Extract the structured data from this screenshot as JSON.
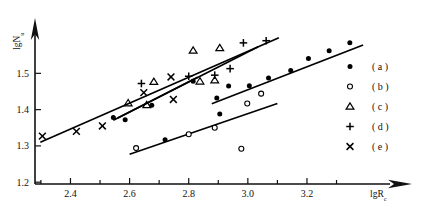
{
  "chart_data": {
    "type": "scatter",
    "title": "",
    "xlabel": "lgR_c",
    "xlabel_main": "lgR",
    "xlabel_sub": "c",
    "ylabel": "lgN_u",
    "ylabel_main": "lgN",
    "ylabel_sub": "u",
    "xlim": [
      2.28,
      3.42
    ],
    "ylim": [
      1.195,
      1.625
    ],
    "grid": false,
    "legend_position": "right",
    "xticks_major": [
      2.4,
      2.6,
      2.8,
      3.0,
      3.2
    ],
    "xticks_major_labels": [
      "2.4",
      "2.6",
      "2.8",
      "3.0",
      "3.2"
    ],
    "xticks_minor": [
      2.3,
      2.5,
      2.7,
      2.9,
      3.1,
      3.3
    ],
    "yticks_major": [
      1.2,
      1.3,
      1.4,
      1.5
    ],
    "yticks_major_labels": [
      "1.2",
      "1.3",
      "1.4",
      "1.5"
    ],
    "series": [
      {
        "name": "(a)",
        "marker": "filled-circle",
        "points": [
          [
            2.545,
            1.378
          ],
          [
            2.585,
            1.372
          ],
          [
            2.675,
            1.412
          ],
          [
            2.815,
            1.478
          ],
          [
            2.895,
            1.432
          ],
          [
            2.905,
            1.388
          ],
          [
            2.935,
            1.465
          ],
          [
            3.005,
            1.466
          ],
          [
            3.07,
            1.487
          ],
          [
            3.145,
            1.508
          ],
          [
            3.205,
            1.541
          ],
          [
            3.275,
            1.562
          ],
          [
            3.345,
            1.584
          ],
          [
            2.72,
            1.317
          ]
        ]
      },
      {
        "name": "(b)",
        "marker": "open-circle",
        "points": [
          [
            2.622,
            1.294
          ],
          [
            2.8,
            1.332
          ],
          [
            2.888,
            1.35
          ],
          [
            2.978,
            1.292
          ],
          [
            2.998,
            1.417
          ],
          [
            3.045,
            1.444
          ]
        ]
      },
      {
        "name": "(c)",
        "marker": "triangle",
        "points": [
          [
            2.595,
            1.418
          ],
          [
            2.658,
            1.413
          ],
          [
            2.682,
            1.477
          ],
          [
            2.815,
            1.563
          ],
          [
            2.838,
            1.478
          ],
          [
            2.888,
            1.481
          ],
          [
            2.905,
            1.57
          ]
        ]
      },
      {
        "name": "(d)",
        "marker": "plus",
        "points": [
          [
            2.64,
            1.472
          ],
          [
            2.8,
            1.492
          ],
          [
            2.888,
            1.495
          ],
          [
            2.94,
            1.513
          ],
          [
            2.985,
            1.584
          ],
          [
            3.062,
            1.59
          ]
        ]
      },
      {
        "name": "(e)",
        "marker": "cross",
        "points": [
          [
            2.305,
            1.327
          ],
          [
            2.42,
            1.34
          ],
          [
            2.508,
            1.355
          ],
          [
            2.648,
            1.447
          ],
          [
            2.74,
            1.49
          ],
          [
            2.748,
            1.428
          ]
        ]
      }
    ],
    "trend_lines": [
      {
        "name": "line-upper-main",
        "x0": 2.298,
        "y0": 1.31,
        "x1": 3.105,
        "y1": 1.598
      },
      {
        "name": "line-upper-secondary",
        "x0": 2.545,
        "y0": 1.371,
        "x1": 3.035,
        "y1": 1.573
      },
      {
        "name": "line-upper-tertiary",
        "x0": 2.56,
        "y0": 1.377,
        "x1": 2.83,
        "y1": 1.489
      },
      {
        "name": "line-middle",
        "x0": 2.878,
        "y0": 1.416,
        "x1": 3.39,
        "y1": 1.578
      },
      {
        "name": "line-lower",
        "x0": 2.6,
        "y0": 1.277,
        "x1": 3.1,
        "y1": 1.417
      }
    ],
    "legend_entries": [
      {
        "marker": "filled-circle",
        "label": "( a )"
      },
      {
        "marker": "open-circle",
        "label": "( b )"
      },
      {
        "marker": "triangle",
        "label": "( c )"
      },
      {
        "marker": "plus",
        "label": "( d )"
      },
      {
        "marker": "cross",
        "label": "( e )"
      }
    ]
  }
}
